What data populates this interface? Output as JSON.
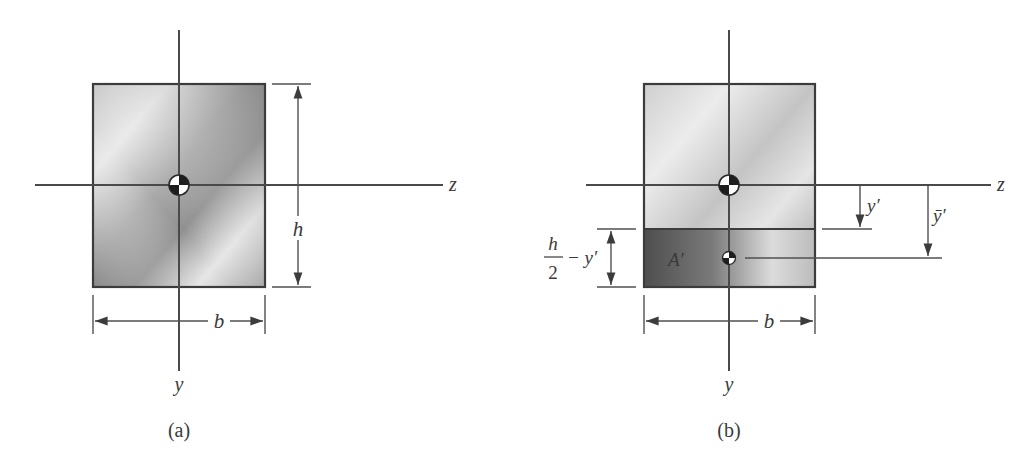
{
  "figure_a": {
    "caption": "(a)",
    "axis_z_label": "z",
    "axis_y_label": "y",
    "height_label": "h",
    "width_label": "b"
  },
  "figure_b": {
    "caption": "(b)",
    "axis_z_label": "z",
    "axis_y_label": "y",
    "width_label": "b",
    "area_label": "A′",
    "y_prime_label": "y′",
    "y_bar_prime_label": "ȳ′",
    "fraction_numerator": "h",
    "fraction_denominator": "2",
    "fraction_suffix": "− y′"
  },
  "colors": {
    "line": "#4a4a4a",
    "fill_light": "#e4e4e4",
    "fill_dark": "#8a8a8a",
    "fill_darkest": "#5a5a5a"
  }
}
